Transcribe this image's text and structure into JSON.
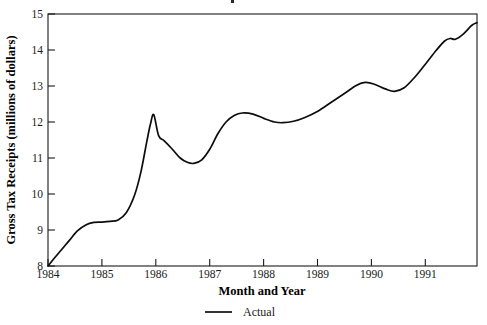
{
  "chart_data": {
    "type": "line",
    "title": "",
    "xlabel": "Month and Year",
    "ylabel": "Gross Tax Receipts (millions of dollars)",
    "xlim": [
      1984.0,
      1991.95
    ],
    "ylim": [
      8,
      15
    ],
    "grid": false,
    "legend_position": "bottom-center",
    "xtick_labels": [
      "1984",
      "1985",
      "1986",
      "1987",
      "1988",
      "1989",
      "1990",
      "1991"
    ],
    "xtick_values": [
      1984,
      1985,
      1986,
      1987,
      1988,
      1989,
      1990,
      1991
    ],
    "ytick_labels": [
      "8",
      "9",
      "10",
      "11",
      "12",
      "13",
      "14",
      "15"
    ],
    "ytick_values": [
      8,
      9,
      10,
      11,
      12,
      13,
      14,
      15
    ],
    "series": [
      {
        "name": "Actual",
        "color": "#0d0d0d",
        "style": "solid",
        "x": [
          1984.0,
          1984.12,
          1984.25,
          1984.4,
          1984.55,
          1984.7,
          1984.85,
          1985.0,
          1985.15,
          1985.3,
          1985.45,
          1985.6,
          1985.72,
          1985.83,
          1985.9,
          1985.96,
          1986.05,
          1986.15,
          1986.3,
          1986.45,
          1986.58,
          1986.7,
          1986.85,
          1987.0,
          1987.15,
          1987.3,
          1987.45,
          1987.6,
          1987.8,
          1988.0,
          1988.2,
          1988.35,
          1988.55,
          1988.75,
          1989.0,
          1989.25,
          1989.5,
          1989.72,
          1989.88,
          1990.05,
          1990.25,
          1990.42,
          1990.6,
          1990.8,
          1991.0,
          1991.2,
          1991.35,
          1991.45,
          1991.55,
          1991.7,
          1991.85,
          1991.95
        ],
        "y": [
          8.0,
          8.22,
          8.45,
          8.72,
          8.98,
          9.14,
          9.21,
          9.22,
          9.24,
          9.28,
          9.48,
          9.95,
          10.6,
          11.45,
          11.95,
          12.2,
          11.62,
          11.48,
          11.25,
          11.0,
          10.88,
          10.85,
          10.95,
          11.25,
          11.68,
          12.0,
          12.18,
          12.25,
          12.22,
          12.1,
          12.0,
          11.98,
          12.02,
          12.12,
          12.3,
          12.55,
          12.8,
          13.02,
          13.1,
          13.05,
          12.92,
          12.85,
          12.95,
          13.25,
          13.62,
          14.0,
          14.25,
          14.32,
          14.3,
          14.45,
          14.68,
          14.76
        ]
      }
    ],
    "annotations": []
  },
  "axes": {
    "y_axis_title": "Gross Tax Receipts (millions of dollars)",
    "x_axis_title": "Month and Year"
  },
  "legend": {
    "entries": [
      {
        "label": "Actual",
        "marker": "line-segment"
      }
    ]
  }
}
